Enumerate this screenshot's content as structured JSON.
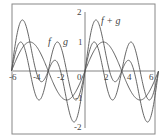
{
  "chart_data": {
    "type": "line",
    "title": "",
    "xlabel": "",
    "ylabel": "",
    "xlim": [
      -6.3,
      6.3
    ],
    "ylim": [
      -2,
      2
    ],
    "grid": false,
    "legend": "inline labels",
    "x_ticks": [
      "-6",
      "-4",
      "-2",
      "0",
      "2",
      "4",
      "6"
    ],
    "y_ticks": [
      "2",
      "1",
      "-1",
      "-2"
    ],
    "series": [
      {
        "name": "f",
        "expression": "sin(x)",
        "x_range": [
          -6.28,
          6.28
        ]
      },
      {
        "name": "g",
        "expression": "sin(2x)",
        "x_range": [
          -6.28,
          6.28
        ]
      },
      {
        "name": "f + g",
        "expression": "sin(x) + sin(2x)",
        "x_range": [
          -6.28,
          6.28
        ]
      }
    ],
    "annotations": [
      {
        "text": "f",
        "x": -3.1,
        "y": 1.05
      },
      {
        "text": "g",
        "x": -1.9,
        "y": 1.05
      },
      {
        "text": "f + g",
        "x": 1.9,
        "y": 1.75
      }
    ]
  },
  "labels": {
    "f": "f",
    "g": "g",
    "fg": "f + g",
    "x_ticks": {
      "m6": "-6",
      "m4": "-4",
      "m2": "-2",
      "zero": "0",
      "p2": "2",
      "p4": "4",
      "p6": "6"
    },
    "y_ticks": {
      "p2": "2",
      "p1": "1",
      "m1": "-1",
      "m2": "-2"
    }
  },
  "colors": {
    "curve": "#555555",
    "axis": "#666666",
    "frame": "#888888"
  }
}
